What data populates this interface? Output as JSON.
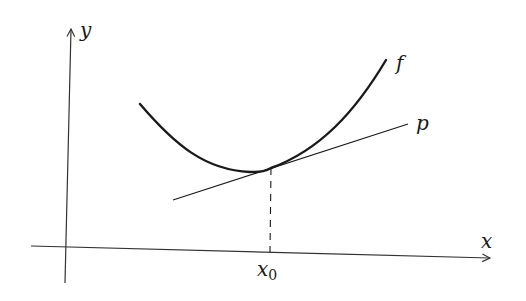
{
  "diagram": {
    "labels": {
      "y_axis": "y",
      "x_axis": "x",
      "function": "f",
      "tangent": "p",
      "point_main": "x",
      "point_sub": "0"
    },
    "colors": {
      "stroke": "#1a1a1a",
      "axis": "#333333",
      "background": "#ffffff"
    }
  }
}
